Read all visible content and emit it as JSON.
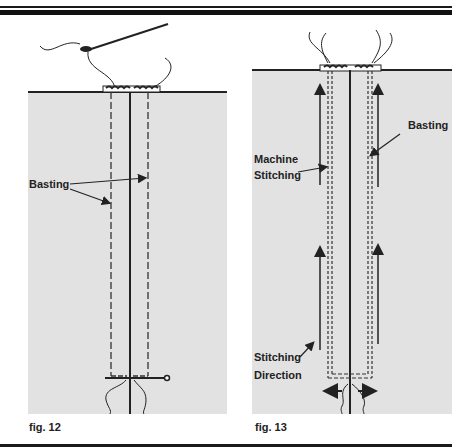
{
  "figures": [
    {
      "id": "fig12",
      "caption": "fig. 12",
      "labels": {
        "basting": "Basting"
      }
    },
    {
      "id": "fig13",
      "caption": "fig. 13",
      "labels": {
        "basting": "Basting",
        "machine_stitching_line1": "Machine",
        "machine_stitching_line2": "Stitching",
        "stitching_direction_line1": "Stitching",
        "stitching_direction_line2": "Direction"
      }
    }
  ],
  "colors": {
    "fabric": "#e2e2e2",
    "ink": "#222222",
    "background": "#ffffff"
  }
}
